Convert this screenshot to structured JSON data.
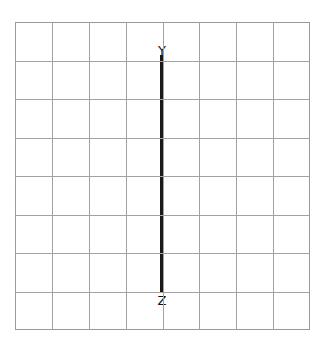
{
  "figure": {
    "type": "geometry-diagram",
    "background_color": "#ffffff",
    "width": 325,
    "height": 346
  },
  "grid": {
    "name": "graph-paper-grid",
    "columns": 8,
    "rows": 8,
    "left": 15,
    "top": 22,
    "width": 295,
    "height": 308,
    "cell_width": 36.875,
    "cell_height": 38.5,
    "line_color": "#a2a2a2",
    "border_color": "#9a9a9a",
    "line_width": 1
  },
  "chart_data": {
    "type": "scatter",
    "title": "",
    "xlabel": "",
    "ylabel": "",
    "grid": true,
    "legend": "none",
    "xlim": [
      0,
      8
    ],
    "ylim": [
      0,
      8
    ],
    "x_ticks": [
      0,
      1,
      2,
      3,
      4,
      5,
      6,
      7,
      8
    ],
    "y_ticks": [
      0,
      1,
      2,
      3,
      4,
      5,
      6,
      7,
      8
    ],
    "x_tick_labels": [
      "",
      "",
      "",
      "",
      "",
      "",
      "",
      "",
      ""
    ],
    "y_tick_labels": [
      "",
      "",
      "",
      "",
      "",
      "",
      "",
      "",
      ""
    ],
    "annotations": [
      {
        "text": "Y",
        "x": 4,
        "y": 7.15
      },
      {
        "text": "Z",
        "x": 4,
        "y": 0.85
      }
    ],
    "series": [
      {
        "name": "segment-YZ",
        "type": "line",
        "color": "#1a1a1a",
        "line_width": 3,
        "x": [
          4,
          4
        ],
        "y": [
          7.15,
          0.98
        ]
      }
    ]
  },
  "segment": {
    "name": "segment-yz",
    "color": "#1a1a1a",
    "thickness": 3,
    "x": 161,
    "top": 55,
    "bottom": 292,
    "length": 237
  },
  "labels": {
    "top": {
      "text": "Y",
      "x": 162,
      "y": 44,
      "color": "#111111",
      "font_size": 13
    },
    "bottom": {
      "text": "Z",
      "x": 162,
      "y": 294,
      "color": "#111111",
      "font_size": 13
    }
  }
}
